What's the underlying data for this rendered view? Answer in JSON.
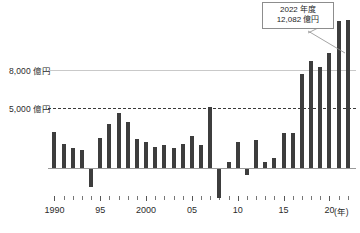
{
  "chart_data": {
    "type": "bar",
    "title": "",
    "subtitle": "",
    "xlabel": "(年)",
    "ylabel": "",
    "unit": "億円",
    "grid": true,
    "legend_position": "none",
    "ylim": [
      -2500,
      12500
    ],
    "xlim": [
      1990,
      2022
    ],
    "categories": [
      "1990",
      "1991",
      "1992",
      "1993",
      "1994",
      "1995",
      "1996",
      "1997",
      "1998",
      "1999",
      "2000",
      "2001",
      "2002",
      "2003",
      "2004",
      "2005",
      "2006",
      "2007",
      "2008",
      "2009",
      "2010",
      "2011",
      "2012",
      "2013",
      "2014",
      "2015",
      "2016",
      "2017",
      "2018",
      "2019",
      "2020",
      "2021",
      "2022"
    ],
    "values": [
      2900,
      2000,
      1600,
      1450,
      -1450,
      2450,
      3600,
      4500,
      3750,
      2350,
      2150,
      1700,
      1900,
      1650,
      1950,
      2600,
      1850,
      5000,
      -2350,
      500,
      2100,
      -450,
      2250,
      450,
      850,
      2850,
      2850,
      7700,
      8700,
      8250,
      9400,
      12000,
      12082
    ],
    "yticks": [
      5000,
      8000
    ],
    "ytick_labels": [
      "5,000 億円",
      "8,000 億円"
    ],
    "xtick_years": [
      1990,
      1995,
      2000,
      2005,
      2010,
      2015,
      2020
    ],
    "xtick_labels": [
      "1990",
      "95",
      "2000",
      "05",
      "10",
      "15",
      "20"
    ],
    "annotation": {
      "line1": "2022 年度",
      "line2": "12,082 億円",
      "target_category": "2022",
      "target_value": 12082
    },
    "colors": {
      "bar": "#3d3d3d",
      "gridline_solid": "#c9c9c9",
      "gridline_dashed": "#3a3a3a",
      "baseline": "#9a9a9a",
      "text": "#2b2b2b",
      "callout_border": "#8d8d8d",
      "background": "#ffffff"
    }
  },
  "y_axis": {
    "label_8000": "8,000 億円",
    "label_5000": "5,000 億円"
  },
  "x_axis": {
    "unit_label": "(年)",
    "labels": [
      "1990",
      "95",
      "2000",
      "05",
      "10",
      "15",
      "20"
    ]
  },
  "callout": {
    "line1": "2022 年度",
    "line2": "12,082 億円"
  }
}
